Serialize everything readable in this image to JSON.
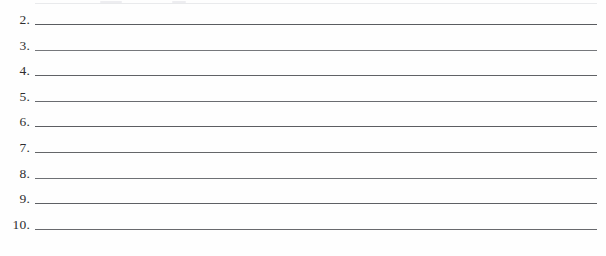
{
  "document": {
    "kind": "scanned-worksheet",
    "description": "Numbered fill-in-the-blank answer lines",
    "background_color": "#fefefe",
    "rule_color": "#5d5f63",
    "number_color": "#2e2e30"
  },
  "clipped_top": {
    "present": true,
    "note": "faint remnant of the preceding line, cropped at the top edge"
  },
  "rows": [
    {
      "number": "2.",
      "answer": ""
    },
    {
      "number": "3.",
      "answer": ""
    },
    {
      "number": "4.",
      "answer": ""
    },
    {
      "number": "5.",
      "answer": ""
    },
    {
      "number": "6.",
      "answer": ""
    },
    {
      "number": "7.",
      "answer": ""
    },
    {
      "number": "8.",
      "answer": ""
    },
    {
      "number": "9.",
      "answer": ""
    },
    {
      "number": "10.",
      "answer": ""
    }
  ]
}
